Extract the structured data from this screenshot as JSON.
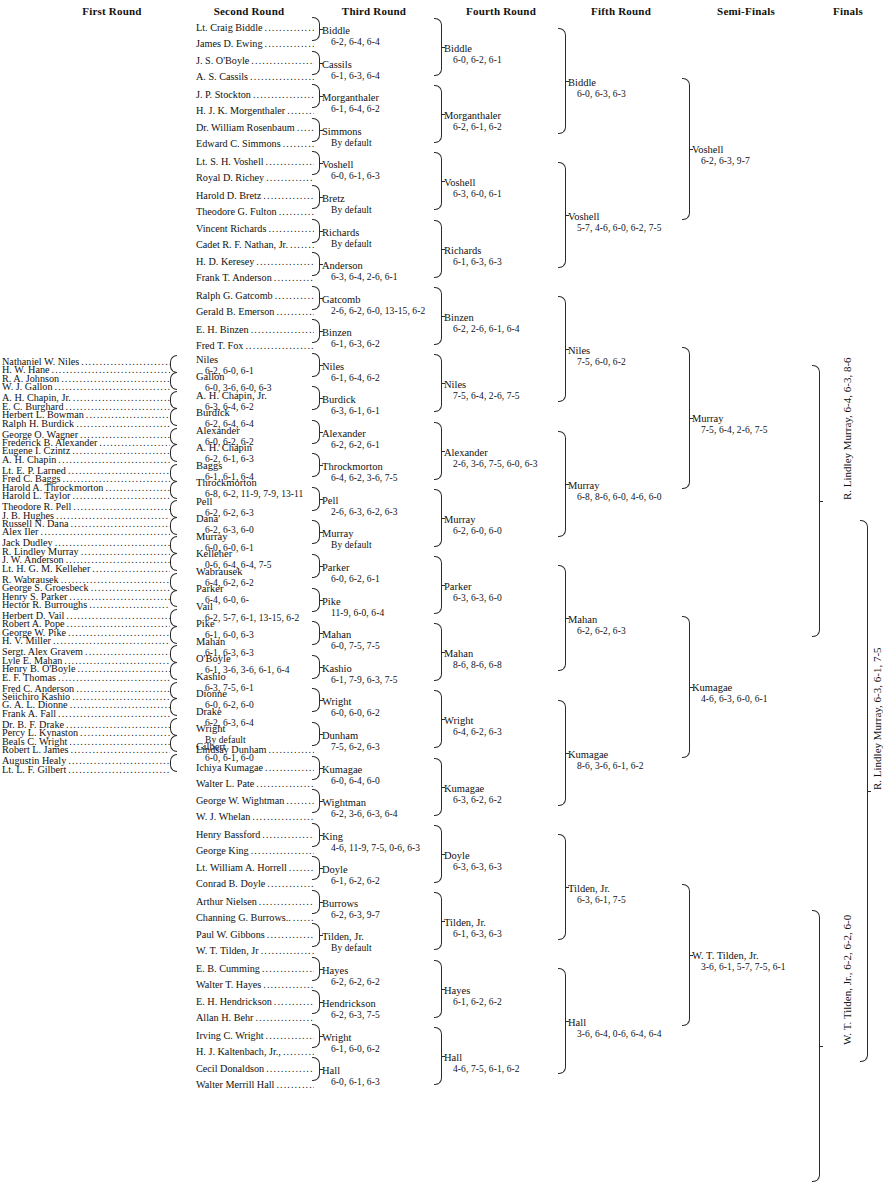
{
  "headers": [
    {
      "label": "First Round",
      "x": 112
    },
    {
      "label": "Second Round",
      "x": 249
    },
    {
      "label": "Third Round",
      "x": 374
    },
    {
      "label": "Fourth Round",
      "x": 501
    },
    {
      "label": "Fifth Round",
      "x": 621
    },
    {
      "label": "Semi-Finals",
      "x": 746
    },
    {
      "label": "Finals",
      "x": 848
    }
  ],
  "round1": [
    {
      "name": "Nathaniel W. Niles"
    },
    {
      "name": "H. W. Hane"
    },
    {
      "name": "R. A. Johnson"
    },
    {
      "name": "W. J. Gallon"
    },
    {
      "name": "A. H. Chapin, Jr."
    },
    {
      "name": "E. C. Burghard"
    },
    {
      "name": "Herbert L. Bowman"
    },
    {
      "name": "Ralph H. Burdick"
    },
    {
      "name": "George O. Wagner"
    },
    {
      "name": "Frederick B. Alexander"
    },
    {
      "name": "Eugene I. Czintz"
    },
    {
      "name": "A. H. Chapin"
    },
    {
      "name": "Lt. E. P. Larned"
    },
    {
      "name": "Fred C. Baggs"
    },
    {
      "name": "Harold A. Throckmorton"
    },
    {
      "name": "Harold L. Taylor"
    },
    {
      "name": "Theodore R. Pell"
    },
    {
      "name": "J. B. Hughes"
    },
    {
      "name": "Russell N. Dana"
    },
    {
      "name": "Alex Iler"
    },
    {
      "name": "Jack Dudley"
    },
    {
      "name": "R. Lindley Murray"
    },
    {
      "name": "J. W. Anderson"
    },
    {
      "name": "Lt. H. G. M. Kelleher"
    },
    {
      "name": "R. Wabrausek"
    },
    {
      "name": "George S. Groesbeck"
    },
    {
      "name": "Henry S. Parker"
    },
    {
      "name": "Hector R. Burroughs"
    },
    {
      "name": "Herbert D. Vail"
    },
    {
      "name": "Robert A. Pope"
    },
    {
      "name": "George W. Pike"
    },
    {
      "name": "H. V. Miller"
    },
    {
      "name": "Sergt. Alex Gravem"
    },
    {
      "name": "Lyle E. Mahan"
    },
    {
      "name": "Henry B. O'Boyle"
    },
    {
      "name": "E. F. Thomas"
    },
    {
      "name": "Fred C. Anderson"
    },
    {
      "name": "Seiichiro Kashio"
    },
    {
      "name": "G. A. L. Dionne"
    },
    {
      "name": "Frank A. Fall"
    },
    {
      "name": "Dr. B. F. Drake"
    },
    {
      "name": "Percy L. Kynaston"
    },
    {
      "name": "Beals C. Wright"
    },
    {
      "name": "Robert L. James"
    },
    {
      "name": "Augustin Healy"
    },
    {
      "name": "Lt. L. F. Gilbert"
    }
  ],
  "round2_entrants": [
    {
      "name": "Lt. Craig Biddle",
      "y": 22
    },
    {
      "name": "James D. Ewing",
      "y": 38
    },
    {
      "name": "J. S. O'Boyle",
      "y": 55
    },
    {
      "name": "A. S. Cassils",
      "y": 71
    },
    {
      "name": "J. P. Stockton",
      "y": 89
    },
    {
      "name": "H. J. K. Morgenthaler",
      "y": 105
    },
    {
      "name": "Dr. William Rosenbaum",
      "y": 122
    },
    {
      "name": "Edward C. Simmons",
      "y": 138
    },
    {
      "name": "Lt. S. H. Voshell",
      "y": 156
    },
    {
      "name": "Royal D. Richey",
      "y": 172
    },
    {
      "name": "Harold D. Bretz",
      "y": 190
    },
    {
      "name": "Theodore G. Fulton",
      "y": 206
    },
    {
      "name": "Vincent Richards",
      "y": 223
    },
    {
      "name": "Cadet R. F. Nathan, Jr.",
      "y": 239
    },
    {
      "name": "H. D. Keresey",
      "y": 256
    },
    {
      "name": "Frank T. Anderson",
      "y": 272
    },
    {
      "name": "Ralph G. Gatcomb",
      "y": 290
    },
    {
      "name": "Gerald B. Emerson",
      "y": 306
    },
    {
      "name": "E. H. Binzen",
      "y": 324
    },
    {
      "name": "Fred T. Fox",
      "y": 340
    },
    {
      "name": "Lindsay Dunham",
      "y": 744
    },
    {
      "name": "Ichiya Kumagae",
      "y": 762
    },
    {
      "name": "Walter L. Pate",
      "y": 778
    },
    {
      "name": "George W. Wightman",
      "y": 795
    },
    {
      "name": "W. J. Whelan",
      "y": 811
    },
    {
      "name": "Henry Bassford",
      "y": 829
    },
    {
      "name": "George King",
      "y": 845
    },
    {
      "name": "Lt. William A. Horrell",
      "y": 862
    },
    {
      "name": "Conrad B. Doyle",
      "y": 878
    },
    {
      "name": "Arthur Nielsen",
      "y": 896
    },
    {
      "name": "Channing G. Burrows..",
      "y": 912
    },
    {
      "name": "Paul W. Gibbons",
      "y": 929
    },
    {
      "name": "W. T. Tilden, Jr",
      "y": 945
    },
    {
      "name": "E. B. Cumming",
      "y": 963
    },
    {
      "name": "Walter T. Hayes",
      "y": 979
    },
    {
      "name": "E. H. Hendrickson",
      "y": 996
    },
    {
      "name": "Allan H. Behr",
      "y": 1012
    },
    {
      "name": "Irving C. Wright",
      "y": 1030
    },
    {
      "name": "H. J. Kaltenbach, Jr.,",
      "y": 1046
    },
    {
      "name": "Cecil Donaldson",
      "y": 1063
    },
    {
      "name": "Walter Merrill Hall",
      "y": 1079
    }
  ],
  "round2_results": [
    {
      "winner": "Niles",
      "score": "6-2, 6-0, 6-1",
      "y": 355
    },
    {
      "winner": "Gallon",
      "score": "6-0, 3-6, 6-0, 6-3",
      "y": 372
    },
    {
      "winner": "A. H. Chapin, Jr.",
      "score": "6-3, 6-4, 6-2",
      "y": 391
    },
    {
      "winner": "Burdick",
      "score": "6-2, 6-4, 6-4",
      "y": 408
    },
    {
      "winner": "Alexander",
      "score": "6-0, 6-2, 6-2",
      "y": 426
    },
    {
      "winner": "A. H. Chapin",
      "score": "6-2, 6-1, 6-3",
      "y": 443
    },
    {
      "winner": "Baggs",
      "score": "6-1, 6-1, 6-4",
      "y": 461
    },
    {
      "winner": "Throckmorton",
      "score": "6-8, 6-2, 11-9, 7-9, 13-11",
      "y": 478
    },
    {
      "winner": "Pell",
      "score": "6-2, 6-2, 6-3",
      "y": 497
    },
    {
      "winner": "Dana",
      "score": "6-2, 6-3, 6-0",
      "y": 514
    },
    {
      "winner": "Murray",
      "score": "6-0, 6-0, 6-1",
      "y": 532
    },
    {
      "winner": "Kelleher",
      "score": "0-6, 6-4, 6-4, 7-5",
      "y": 549
    },
    {
      "winner": "Wabrausek",
      "score": "6-4, 6-2, 6-2",
      "y": 567
    },
    {
      "winner": "Parker",
      "score": "6-4, 6-0, 6-",
      "y": 584
    },
    {
      "winner": "Vail",
      "score": "6-2, 5-7, 6-1, 13-15, 6-2",
      "y": 602
    },
    {
      "winner": "Pike",
      "score": "6-1, 6-0, 6-3",
      "y": 619
    },
    {
      "winner": "Mahan",
      "score": "6-1, 6-3, 6-3",
      "y": 637
    },
    {
      "winner": "O'Boyle",
      "score": "6-1, 3-6, 3-6, 6-1, 6-4",
      "y": 654
    },
    {
      "winner": "Kashio",
      "score": "6-3, 7-5, 6-1",
      "y": 672
    },
    {
      "winner": "Dionne",
      "score": "6-0, 6-2, 6-0",
      "y": 689
    },
    {
      "winner": "Drake",
      "score": "6-2, 6-3, 6-4",
      "y": 707
    },
    {
      "winner": "Wright",
      "score": "By default",
      "y": 724
    },
    {
      "winner": "Gilbert",
      "score": "6-0, 6-1, 6-0",
      "y": 742
    }
  ],
  "round3": [
    {
      "winner": "Biddle",
      "score": "6-2, 6-4, 6-4",
      "y": 26
    },
    {
      "winner": "Cassils",
      "score": "6-1, 6-3, 6-4",
      "y": 60
    },
    {
      "winner": "Morganthaler",
      "score": "6-1, 6-4, 6-2",
      "y": 93
    },
    {
      "winner": "Simmons",
      "score": "By default",
      "y": 127
    },
    {
      "winner": "Voshell",
      "score": "6-0, 6-1, 6-3",
      "y": 160
    },
    {
      "winner": "Bretz",
      "score": "By default",
      "y": 194
    },
    {
      "winner": "Richards",
      "score": "By default",
      "y": 228
    },
    {
      "winner": "Anderson",
      "score": "6-3, 6-4, 2-6, 6-1",
      "y": 261
    },
    {
      "winner": "Gatcomb",
      "score": "2-6, 6-2, 6-0, 13-15, 6-2",
      "y": 295
    },
    {
      "winner": "Binzen",
      "score": "6-1, 6-3, 6-2",
      "y": 328
    },
    {
      "winner": "Niles",
      "score": "6-1, 6-4, 6-2",
      "y": 362
    },
    {
      "winner": "Burdick",
      "score": "6-3, 6-1, 6-1",
      "y": 395
    },
    {
      "winner": "Alexander",
      "score": "6-2, 6-2, 6-1",
      "y": 429
    },
    {
      "winner": "Throckmorton",
      "score": "6-4, 6-2, 3-6, 7-5",
      "y": 462
    },
    {
      "winner": "Pell",
      "score": "2-6, 6-3, 6-2, 6-3",
      "y": 496
    },
    {
      "winner": "Murray",
      "score": "By default",
      "y": 529
    },
    {
      "winner": "Parker",
      "score": "6-0, 6-2, 6-1",
      "y": 563
    },
    {
      "winner": "Pike",
      "score": "11-9, 6-0, 6-4",
      "y": 597
    },
    {
      "winner": "Mahan",
      "score": "6-0, 7-5, 7-5",
      "y": 630
    },
    {
      "winner": "Kashio",
      "score": "6-1, 7-9, 6-3, 7-5",
      "y": 664
    },
    {
      "winner": "Wright",
      "score": "6-0, 6-0, 6-2",
      "y": 697
    },
    {
      "winner": "Dunham",
      "score": "7-5, 6-2, 6-3",
      "y": 731
    },
    {
      "winner": "Kumagae",
      "score": "6-0, 6-4, 6-0",
      "y": 765
    },
    {
      "winner": "Wightman",
      "score": "6-2, 3-6, 6-3, 6-4",
      "y": 798
    },
    {
      "winner": "King",
      "score": "4-6, 11-9, 7-5, 0-6, 6-3",
      "y": 832
    },
    {
      "winner": "Doyle",
      "score": "6-1, 6-2, 6-2",
      "y": 865
    },
    {
      "winner": "Burrows",
      "score": "6-2, 6-3, 9-7",
      "y": 899
    },
    {
      "winner": "Tilden, Jr.",
      "score": "By default",
      "y": 932
    },
    {
      "winner": "Hayes",
      "score": "6-2, 6-2, 6-2",
      "y": 966
    },
    {
      "winner": "Hendrickson",
      "score": "6-2, 6-3, 7-5",
      "y": 999
    },
    {
      "winner": "Wright",
      "score": "6-1, 6-0, 6-2",
      "y": 1033
    },
    {
      "winner": "Hall",
      "score": "6-0, 6-1, 6-3",
      "y": 1066
    }
  ],
  "round4": [
    {
      "winner": "Biddle",
      "score": "6-0, 6-2, 6-1",
      "y": 44
    },
    {
      "winner": "Morganthaler",
      "score": "6-2, 6-1, 6-2",
      "y": 111
    },
    {
      "winner": "Voshell",
      "score": "6-3, 6-0, 6-1",
      "y": 178
    },
    {
      "winner": "Richards",
      "score": "6-1, 6-3, 6-3",
      "y": 246
    },
    {
      "winner": "Binzen",
      "score": "6-2, 2-6, 6-1, 6-4",
      "y": 313
    },
    {
      "winner": "Niles",
      "score": "7-5, 6-4, 2-6, 7-5",
      "y": 380
    },
    {
      "winner": "Alexander",
      "score": "2-6, 3-6, 7-5, 6-0, 6-3",
      "y": 448
    },
    {
      "winner": "Murray",
      "score": "6-2, 6-0, 6-0",
      "y": 515
    },
    {
      "winner": "Parker",
      "score": "6-3, 6-3, 6-0",
      "y": 582
    },
    {
      "winner": "Mahan",
      "score": "8-6, 8-6, 6-8",
      "y": 649
    },
    {
      "winner": "Wright",
      "score": "6-4, 6-2, 6-3",
      "y": 716
    },
    {
      "winner": "Kumagae",
      "score": "6-3, 6-2, 6-2",
      "y": 784
    },
    {
      "winner": "Doyle",
      "score": "6-3, 6-3, 6-3",
      "y": 851
    },
    {
      "winner": "Tilden, Jr.",
      "score": "6-1, 6-3, 6-3",
      "y": 918
    },
    {
      "winner": "Hayes",
      "score": "6-1, 6-2, 6-2",
      "y": 986
    },
    {
      "winner": "Hall",
      "score": "4-6, 7-5, 6-1, 6-2",
      "y": 1053
    }
  ],
  "round5": [
    {
      "winner": "Biddle",
      "score": "6-0, 6-3, 6-3",
      "y": 78
    },
    {
      "winner": "Voshell",
      "score": "5-7, 4-6, 6-0, 6-2, 7-5",
      "y": 212
    },
    {
      "winner": "Niles",
      "score": "7-5, 6-0, 6-2",
      "y": 346
    },
    {
      "winner": "Murray",
      "score": "6-8, 8-6, 6-0, 4-6, 6-0",
      "y": 481
    },
    {
      "winner": "Mahan",
      "score": "6-2, 6-2, 6-3",
      "y": 615
    },
    {
      "winner": "Kumagae",
      "score": "8-6, 3-6, 6-1, 6-2",
      "y": 750
    },
    {
      "winner": "Tilden, Jr.",
      "score": "6-3, 6-1, 7-5",
      "y": 884
    },
    {
      "winner": "Hall",
      "score": "3-6, 6-4, 0-6, 6-4, 6-4",
      "y": 1018
    }
  ],
  "semifinals": [
    {
      "winner": "Voshell",
      "score": "6-2, 6-3, 9-7",
      "y": 145
    },
    {
      "winner": "Murray",
      "score": "7-5, 6-4, 2-6, 7-5",
      "y": 414
    },
    {
      "winner": "Kumagae",
      "score": "4-6, 6-3, 6-0, 6-1",
      "y": 683
    },
    {
      "winner": "W. T. Tilden, Jr.",
      "score": "3-6, 6-1, 5-7, 7-5, 6-1",
      "y": 951
    }
  ],
  "finals_vertical": [
    {
      "text": "R. Lindley Murray, 6-4, 6-3, 8-6",
      "x": 841,
      "y": 500
    },
    {
      "text": "W. T. Tilden, Jr., 6-2, 6-2, 6-0",
      "x": 841,
      "y": 1045
    }
  ],
  "champion_vertical": {
    "text": "R. Lindley Murray, 6-3, 6-1, 7-5",
    "x": 871,
    "y": 790
  }
}
